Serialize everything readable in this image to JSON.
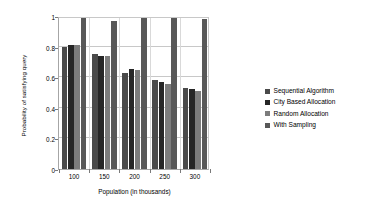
{
  "chart_data": {
    "type": "bar",
    "title": "",
    "subtitle": "",
    "xlabel": "Population (in thousands)",
    "ylabel": "Probability of satisfying query",
    "categories": [
      "100",
      "150",
      "200",
      "250",
      "300"
    ],
    "series": [
      {
        "name": "Sequential Algorithm",
        "color": "#4a4a4a",
        "values": [
          0.8,
          0.75,
          0.63,
          0.58,
          0.53
        ]
      },
      {
        "name": "City Based Allocation",
        "color": "#262626",
        "values": [
          0.81,
          0.74,
          0.655,
          0.57,
          0.52
        ]
      },
      {
        "name": "Random Allocation",
        "color": "#7c7c7c",
        "values": [
          0.81,
          0.74,
          0.645,
          0.555,
          0.51
        ]
      },
      {
        "name": "With Sampling",
        "color": "#585858",
        "values": [
          0.99,
          0.97,
          0.99,
          0.985,
          0.98
        ]
      }
    ],
    "ylim": [
      0,
      1
    ],
    "yticks": [
      "0",
      "0.2",
      "0.4",
      "0.6",
      "0.8",
      "1"
    ],
    "ytickvalues": [
      0,
      0.2,
      0.4,
      0.6,
      0.8,
      1
    ],
    "grid": "horizontal",
    "legend_position": "right",
    "plot_background": "#ffffff",
    "gridline_color": "#c8c8c8",
    "axis_color": "#a6a6a6"
  },
  "legend": {
    "items": [
      {
        "label": "Sequential Algorithm"
      },
      {
        "label": "City Based Allocation"
      },
      {
        "label": "Random Allocation"
      },
      {
        "label": "With Sampling"
      }
    ]
  }
}
